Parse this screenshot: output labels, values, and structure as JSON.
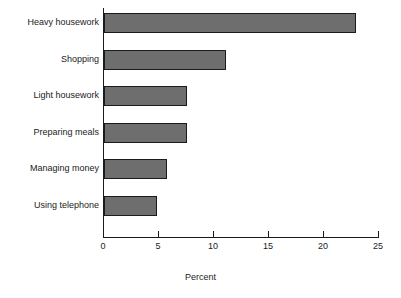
{
  "chart_data": {
    "type": "bar",
    "orientation": "horizontal",
    "title": "",
    "xlabel": "Percent",
    "ylabel": "",
    "categories": [
      "Heavy housework",
      "Shopping",
      "Light housework",
      "Preparing meals",
      "Managing money",
      "Using telephone"
    ],
    "values": [
      22.9,
      11.1,
      7.5,
      7.5,
      5.7,
      4.8
    ],
    "xlim": [
      0,
      25
    ],
    "xticks": [
      0,
      5,
      10,
      15,
      20,
      25
    ],
    "xtick_labels": [
      "0",
      "5",
      "10",
      "15",
      "20",
      "25"
    ],
    "grid": false,
    "legend": null,
    "bar_fill_color": "#6e6e6e",
    "bar_edge_color": "#1b1b1b",
    "axis_color": "#1b1b1b",
    "background_color": "#ffffff"
  }
}
